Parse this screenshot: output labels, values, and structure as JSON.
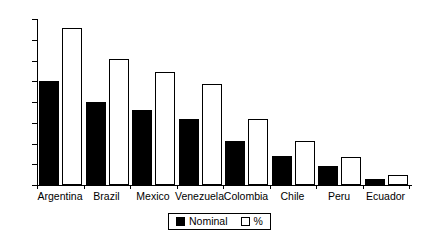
{
  "chart_data": {
    "type": "bar",
    "title": "",
    "subtitle": "",
    "xlabel": "",
    "ylabel": "",
    "ylim": [
      0,
      80
    ],
    "yticks": [
      0,
      10,
      20,
      30,
      40,
      50,
      60,
      70,
      80
    ],
    "ytick_labels": [
      "0",
      "10",
      "20",
      "30",
      "40",
      "50",
      "60",
      "70",
      "80"
    ],
    "grid": false,
    "legend_position": "bottom-center",
    "categories": [
      "Argentina",
      "Brazil",
      "Mexico",
      "Venezuela",
      "Colombia",
      "Chile",
      "Peru",
      "Ecuador"
    ],
    "series": [
      {
        "name": "Nominal",
        "color": "#000000",
        "style": "filled",
        "values": [
          50,
          40,
          36,
          32,
          21,
          14,
          9,
          3
        ]
      },
      {
        "name": "%",
        "color": "#ffffff",
        "style": "hollow",
        "values": [
          75.5,
          60.5,
          54.5,
          48.5,
          31.8,
          21.3,
          13.5,
          4.6
        ]
      }
    ]
  },
  "legend": {
    "entries": [
      {
        "label": "Nominal",
        "swatch": "filled-square-icon"
      },
      {
        "label": "%",
        "swatch": "hollow-square-icon"
      }
    ]
  },
  "colors": {
    "axis": "#000000",
    "background": "#ffffff",
    "nominal": "#000000",
    "percent": "#ffffff"
  }
}
